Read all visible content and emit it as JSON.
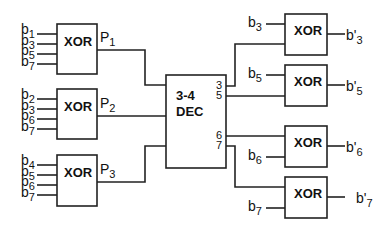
{
  "diagram": {
    "type": "hamming-code-error-correction-circuit",
    "encoder_gates": [
      {
        "label": "XOR",
        "inputs": [
          {
            "base": "b",
            "sub": "1"
          },
          {
            "base": "b",
            "sub": "3"
          },
          {
            "base": "b",
            "sub": "5"
          },
          {
            "base": "b",
            "sub": "7"
          }
        ],
        "output": {
          "base": "P",
          "sub": "1"
        }
      },
      {
        "label": "XOR",
        "inputs": [
          {
            "base": "b",
            "sub": "2"
          },
          {
            "base": "b",
            "sub": "3"
          },
          {
            "base": "b",
            "sub": "6"
          },
          {
            "base": "b",
            "sub": "7"
          }
        ],
        "output": {
          "base": "P",
          "sub": "2"
        }
      },
      {
        "label": "XOR",
        "inputs": [
          {
            "base": "b",
            "sub": "4"
          },
          {
            "base": "b",
            "sub": "5"
          },
          {
            "base": "b",
            "sub": "6"
          },
          {
            "base": "b",
            "sub": "7"
          }
        ],
        "output": {
          "base": "P",
          "sub": "3"
        }
      }
    ],
    "decoder": {
      "line1": "3-4",
      "line2": "DEC",
      "outputs": [
        "3",
        "5",
        "6",
        "7"
      ]
    },
    "correction_gates": [
      {
        "label": "XOR",
        "data_input": {
          "base": "b",
          "sub": "3"
        },
        "decoder_input": "3",
        "output": {
          "base": "b'",
          "sub": "3"
        }
      },
      {
        "label": "XOR",
        "data_input": {
          "base": "b",
          "sub": "5"
        },
        "decoder_input": "5",
        "output": {
          "base": "b'",
          "sub": "5"
        }
      },
      {
        "label": "XOR",
        "data_input": {
          "base": "b",
          "sub": "6"
        },
        "decoder_input": "6",
        "output": {
          "base": "b'",
          "sub": "6"
        }
      },
      {
        "label": "XOR",
        "data_input": {
          "base": "b",
          "sub": "7"
        },
        "decoder_input": "7",
        "output": {
          "base": "b'",
          "sub": "7"
        }
      }
    ]
  }
}
